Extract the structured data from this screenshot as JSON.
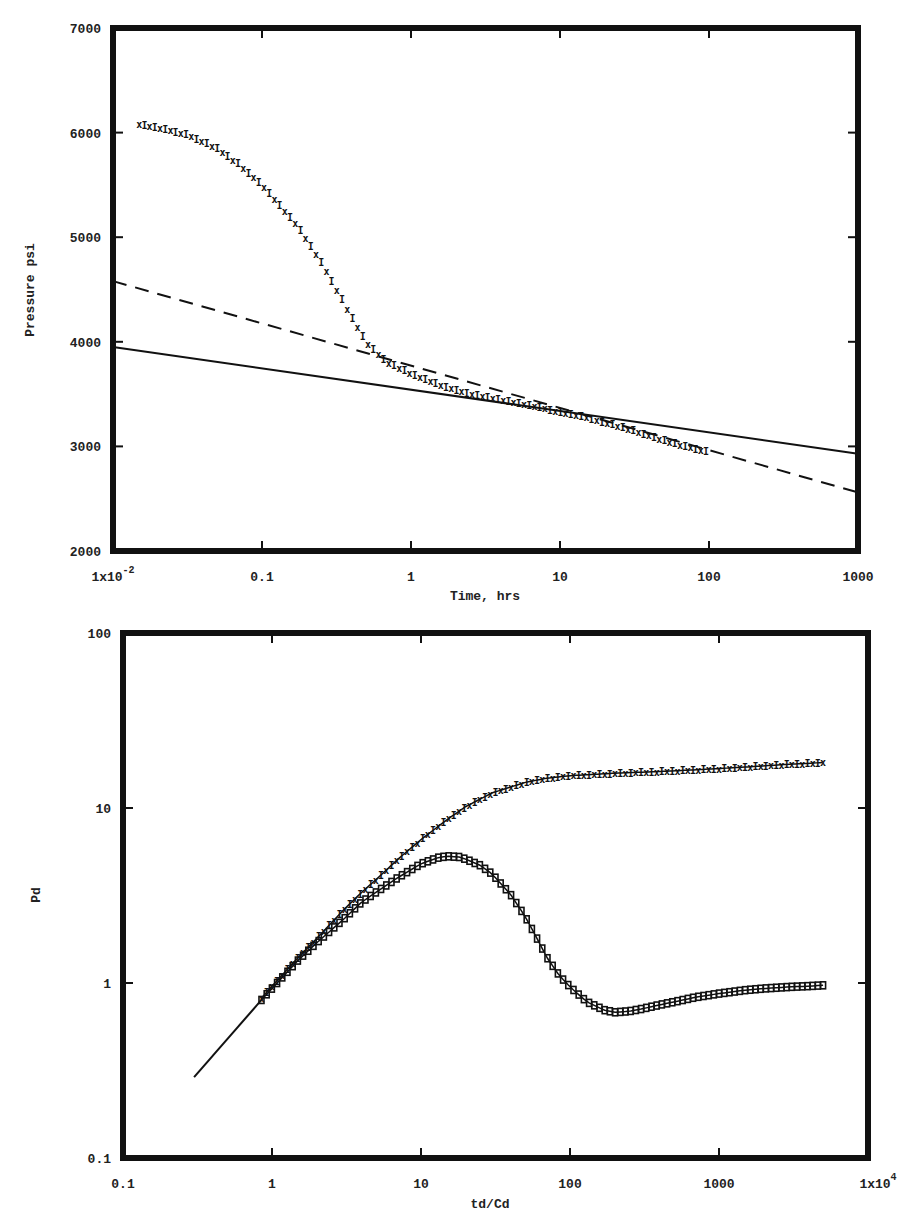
{
  "chart_data": [
    {
      "type": "scatter",
      "title": "",
      "xlabel": "Time, hrs",
      "ylabel": "Pressure psi",
      "xscale": "log",
      "yscale": "linear",
      "xlim": [
        0.01,
        1000
      ],
      "ylim": [
        2000,
        7000
      ],
      "grid": false,
      "legend": null,
      "x_tick_labels": [
        "1x10^-2",
        "0.1",
        "1",
        "10",
        "100",
        "1000"
      ],
      "x_ticks": [
        0.01,
        0.1,
        1,
        10,
        100,
        1000
      ],
      "y_tick_labels": [
        "2000",
        "3000",
        "4000",
        "5000",
        "6000",
        "7000"
      ],
      "y_ticks": [
        2000,
        3000,
        4000,
        5000,
        6000,
        7000
      ],
      "series": [
        {
          "name": "measured pressure",
          "style": "markers-x",
          "x": [
            0.015,
            0.02,
            0.03,
            0.04,
            0.05,
            0.07,
            0.1,
            0.13,
            0.17,
            0.2,
            0.25,
            0.3,
            0.4,
            0.5,
            0.7,
            1,
            1.5,
            2,
            3,
            5,
            7,
            10,
            15,
            20,
            30,
            50,
            70,
            100
          ],
          "y": [
            6080,
            6050,
            5990,
            5920,
            5850,
            5700,
            5500,
            5320,
            5120,
            4980,
            4760,
            4560,
            4240,
            4000,
            3800,
            3700,
            3600,
            3540,
            3480,
            3420,
            3380,
            3330,
            3280,
            3230,
            3160,
            3060,
            3000,
            2950
          ]
        },
        {
          "name": "semilog straight line (solid)",
          "style": "solid",
          "x": [
            0.01,
            1000
          ],
          "y": [
            3950,
            2930
          ]
        },
        {
          "name": "semilog straight line (dashed)",
          "style": "dashed",
          "x": [
            0.01,
            1000
          ],
          "y": [
            4580,
            2560
          ]
        }
      ]
    },
    {
      "type": "scatter",
      "title": "",
      "xlabel": "td/Cd",
      "ylabel": "Pd",
      "xscale": "log",
      "yscale": "log",
      "xlim": [
        0.1,
        10000
      ],
      "ylim": [
        0.1,
        100
      ],
      "grid": false,
      "legend": null,
      "x_tick_labels": [
        "0.1",
        "1",
        "10",
        "100",
        "1000",
        "1x10^4"
      ],
      "x_ticks": [
        0.1,
        1,
        10,
        100,
        1000,
        10000
      ],
      "y_tick_labels": [
        "0.1",
        "1",
        "10",
        "100"
      ],
      "y_ticks": [
        0.1,
        1,
        10,
        100
      ],
      "series": [
        {
          "name": "unit-slope line",
          "style": "solid",
          "x": [
            0.3,
            0.85
          ],
          "y": [
            0.29,
            0.8
          ]
        },
        {
          "name": "pressure Pd",
          "style": "markers-x",
          "x": [
            0.85,
            1,
            1.5,
            2,
            3,
            4,
            5,
            7,
            10,
            15,
            20,
            30,
            50,
            70,
            100,
            200,
            500,
            1000,
            2000,
            3000,
            4000,
            5000
          ],
          "y": [
            0.82,
            0.96,
            1.4,
            1.8,
            2.6,
            3.3,
            3.9,
            5.1,
            6.6,
            8.6,
            10.2,
            12.2,
            14.0,
            14.8,
            15.3,
            15.8,
            16.3,
            16.8,
            17.4,
            17.8,
            18.0,
            18.2
          ]
        },
        {
          "name": "pressure derivative Pd'",
          "style": "markers-square",
          "x": [
            0.85,
            1,
            1.5,
            2,
            3,
            4,
            5,
            7,
            10,
            13,
            15,
            18,
            20,
            25,
            30,
            40,
            50,
            60,
            70,
            85,
            100,
            130,
            170,
            200,
            250,
            300,
            400,
            500,
            700,
            1000,
            1500,
            2000,
            3000,
            4000,
            5000
          ],
          "y": [
            0.8,
            0.93,
            1.35,
            1.7,
            2.3,
            2.9,
            3.3,
            4.0,
            4.8,
            5.2,
            5.3,
            5.25,
            5.1,
            4.7,
            4.2,
            3.2,
            2.4,
            1.8,
            1.4,
            1.1,
            0.95,
            0.78,
            0.7,
            0.68,
            0.69,
            0.71,
            0.75,
            0.78,
            0.83,
            0.87,
            0.91,
            0.93,
            0.95,
            0.96,
            0.97
          ]
        }
      ]
    }
  ],
  "labels": {
    "top_xlabel": "Time, hrs",
    "top_ylabel": "Pressure psi",
    "bottom_xlabel": "td/Cd",
    "bottom_ylabel": "Pd"
  }
}
